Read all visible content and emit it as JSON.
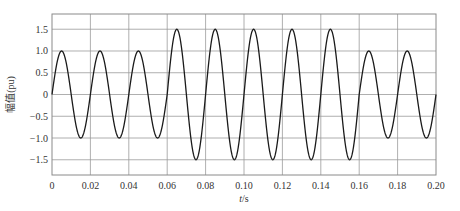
{
  "chart_data": {
    "type": "line",
    "title": "",
    "xlabel": "t/s",
    "ylabel": "幅值(pu)",
    "xlim": [
      0,
      0.2
    ],
    "ylim": [
      -1.85,
      1.85
    ],
    "grid": true,
    "legend": null,
    "xticks": [
      0,
      0.02,
      0.04,
      0.06,
      0.08,
      0.1,
      0.12,
      0.14,
      0.16,
      0.18,
      0.2
    ],
    "xtick_labels": [
      "0",
      "0.02",
      "0.04",
      "0.06",
      "0.08",
      "0.10",
      "0.12",
      "0.14",
      "0.16",
      "0.18",
      "0.20"
    ],
    "yticks": [
      1.5,
      1.0,
      0.5,
      0,
      -0.5,
      -1.0,
      -1.5
    ],
    "ytick_labels": [
      "1.5",
      "1.0",
      "0.5",
      "0",
      "−0.5",
      "−1.0",
      "−1.5"
    ],
    "series": [
      {
        "name": "voltage",
        "color": "#1a1a1a",
        "frequency_hz": 50,
        "segments": [
          {
            "t_start": 0.0,
            "t_end": 0.06,
            "amplitude": 1.0
          },
          {
            "t_start": 0.06,
            "t_end": 0.16,
            "amplitude": 1.5
          },
          {
            "t_start": 0.16,
            "t_end": 0.2,
            "amplitude": 1.0
          }
        ]
      }
    ]
  },
  "colors": {
    "grid": "#9a9a9a",
    "frame": "#8a8a8a",
    "curve": "#1a1a1a",
    "text": "#333333"
  }
}
